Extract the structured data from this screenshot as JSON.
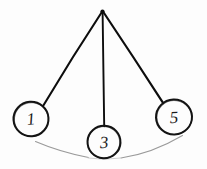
{
  "diagram": {
    "style": "hand-drawn pencil sketch",
    "background_color": "#fdfdfd",
    "stroke_color": "#0d0d0d",
    "arc_color": "#9a9a9a",
    "pivot": {
      "label": "pivot-point",
      "x": 102,
      "y": 11
    },
    "bobs": [
      {
        "label": "1",
        "name": "bob-left",
        "cx": 31,
        "cy": 119,
        "r": 17.5,
        "attach_x": 43,
        "attach_y": 106
      },
      {
        "label": "3",
        "name": "bob-middle",
        "cx": 104,
        "cy": 142,
        "r": 16.5,
        "attach_x": 104,
        "attach_y": 126
      },
      {
        "label": "5",
        "name": "bob-right",
        "cx": 174,
        "cy": 117,
        "r": 18,
        "attach_x": 163,
        "attach_y": 103
      }
    ],
    "arc": {
      "name": "swing-path-arc",
      "start_x": 35,
      "start_y": 141,
      "end_x": 183,
      "end_y": 135,
      "sag_y": 163
    }
  }
}
